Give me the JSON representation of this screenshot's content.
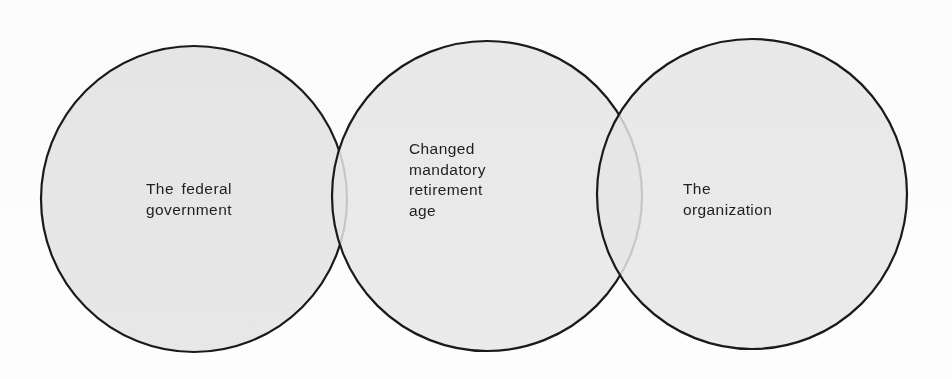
{
  "diagram": {
    "type": "venn",
    "title": "",
    "background_color": "#fefefe",
    "circle_fill_color": "#e8e8e8",
    "circle_stroke_color": "#1a1a1a",
    "text_color": "#1f1f1f",
    "sets": [
      {
        "id": "left",
        "label": "The federal\ngovernment",
        "cx": 194,
        "cy": 199,
        "r": 153
      },
      {
        "id": "middle",
        "label": "Changed\nmandatory\nretirement\nage",
        "cx": 487,
        "cy": 196,
        "r": 155
      },
      {
        "id": "right",
        "label": "The\norganization",
        "cx": 752,
        "cy": 194,
        "r": 155
      }
    ]
  }
}
